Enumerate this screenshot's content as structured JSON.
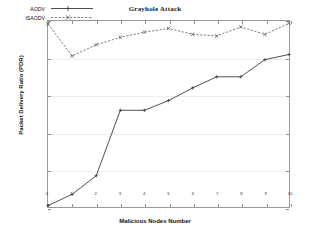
{
  "chart_data": {
    "type": "line",
    "title": "Grayhole Attack",
    "xlabel": "Malicious Nodes Number",
    "ylabel": "Packet Delivery Ratio (PDR)",
    "x": [
      0,
      1,
      2,
      3,
      4,
      5,
      6,
      7,
      8,
      9,
      10
    ],
    "xlim": [
      0,
      10
    ],
    "ylim": [
      94,
      96.5
    ],
    "xticks": [
      "0",
      "1",
      "2",
      "3",
      "4",
      "5",
      "6",
      "7",
      "8",
      "9",
      "10"
    ],
    "yticks": [
      "94",
      "94.5",
      "95",
      "95.5",
      "96",
      "96.5"
    ],
    "ytick_values": [
      94,
      94.5,
      95,
      95.5,
      96,
      96.5
    ],
    "grid": true,
    "legend_position": "top-left",
    "series": [
      {
        "name": "AODV",
        "style": "solid",
        "marker": "plus",
        "color": "#3b3b3b",
        "values": [
          94.02,
          94.17,
          94.42,
          95.3,
          95.3,
          95.43,
          95.6,
          95.75,
          95.75,
          95.98,
          96.05
        ]
      },
      {
        "name": "ISAODV",
        "style": "dashed",
        "marker": "cross",
        "color": "#5a5a5a",
        "values": [
          96.46,
          96.03,
          96.18,
          96.28,
          96.35,
          96.4,
          96.32,
          96.3,
          96.42,
          96.32,
          96.47
        ]
      }
    ]
  }
}
